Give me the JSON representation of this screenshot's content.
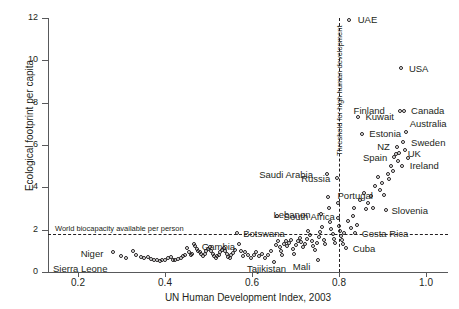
{
  "chart_data": {
    "type": "scatter",
    "title": "",
    "xlabel": "UN Human Development Index, 2003",
    "ylabel": "Ecological footprint per capita",
    "xlim": [
      0.13,
      1.05
    ],
    "ylim": [
      0,
      12
    ],
    "xticks": [
      0.2,
      0.4,
      0.6,
      0.8,
      1.0
    ],
    "xtick_labels": [
      "0.2",
      "0.4",
      "0.6",
      "0.8",
      "1.0"
    ],
    "yticks": [
      0,
      2,
      4,
      6,
      8,
      10,
      12
    ],
    "ytick_labels": [
      "0",
      "2",
      "4",
      "6",
      "8",
      "10",
      "12"
    ],
    "grid": false,
    "legend": null,
    "marker": "open-circle",
    "annotations": {
      "threshold_line": {
        "orientation": "vertical",
        "value": 0.8,
        "style": "dashed",
        "label": "Threshold for high human development"
      },
      "biocapacity_line": {
        "orientation": "horizontal",
        "value": 1.8,
        "style": "dashed",
        "label": "World biocapacity available per person"
      }
    },
    "labeled_points": [
      {
        "name": "UAE",
        "x": 0.824,
        "y": 11.9,
        "lx": 8,
        "ly": -5
      },
      {
        "name": "USA",
        "x": 0.944,
        "y": 9.6,
        "lx": 7,
        "ly": -5
      },
      {
        "name": "Canada",
        "x": 0.949,
        "y": 7.6,
        "lx": 7,
        "ly": -5
      },
      {
        "name": "Finland",
        "x": 0.941,
        "y": 7.6,
        "lx": -47,
        "ly": -5
      },
      {
        "name": "Kuwait",
        "x": 0.844,
        "y": 7.3,
        "lx": 7,
        "ly": -5
      },
      {
        "name": "Australia",
        "x": 0.955,
        "y": 6.6,
        "lx": 3,
        "ly": -13
      },
      {
        "name": "Estonia",
        "x": 0.853,
        "y": 6.5,
        "lx": 7,
        "ly": -5
      },
      {
        "name": "Sweden",
        "x": 0.949,
        "y": 6.1,
        "lx": 7,
        "ly": -5
      },
      {
        "name": "NZ",
        "x": 0.933,
        "y": 5.9,
        "lx": -20,
        "ly": -5
      },
      {
        "name": "UK",
        "x": 0.939,
        "y": 5.6,
        "lx": 8,
        "ly": -4
      },
      {
        "name": "Spain",
        "x": 0.928,
        "y": 5.4,
        "lx": -32,
        "ly": -5
      },
      {
        "name": "Ireland",
        "x": 0.946,
        "y": 5.0,
        "lx": 7,
        "ly": -5
      },
      {
        "name": "Saudi Arabia",
        "x": 0.772,
        "y": 4.6,
        "lx": -68,
        "ly": -5
      },
      {
        "name": "Russia",
        "x": 0.795,
        "y": 4.4,
        "lx": -36,
        "ly": -5
      },
      {
        "name": "Portugal",
        "x": 0.904,
        "y": 3.6,
        "lx": -47,
        "ly": -5
      },
      {
        "name": "Slovenia",
        "x": 0.904,
        "y": 2.9,
        "lx": 7,
        "ly": -5
      },
      {
        "name": "Lebanon",
        "x": 0.759,
        "y": 2.7,
        "lx": -48,
        "ly": -5
      },
      {
        "name": "South Africa",
        "x": 0.658,
        "y": 2.6,
        "lx": 6,
        "ly": -5
      },
      {
        "name": "Botswana",
        "x": 0.565,
        "y": 1.8,
        "lx": 6,
        "ly": -5
      },
      {
        "name": "Costa Rica",
        "x": 0.838,
        "y": 1.8,
        "lx": 6,
        "ly": -5
      },
      {
        "name": "Gambia",
        "x": 0.47,
        "y": 1.2,
        "lx": 6,
        "ly": -5
      },
      {
        "name": "Cuba",
        "x": 0.817,
        "y": 1.1,
        "lx": 6,
        "ly": -5
      },
      {
        "name": "Niger",
        "x": 0.281,
        "y": 0.9,
        "lx": -33,
        "ly": -4
      },
      {
        "name": "Tajikistan",
        "x": 0.652,
        "y": 0.45,
        "lx": -28,
        "ly": 2
      },
      {
        "name": "Mali",
        "x": 0.753,
        "y": 0.55,
        "lx": -26,
        "ly": 2
      },
      {
        "name": "Sierra Leone",
        "x": 0.298,
        "y": 0.45,
        "lx": -68,
        "ly": 2
      }
    ],
    "points": [
      [
        0.281,
        0.9
      ],
      [
        0.298,
        0.75
      ],
      [
        0.311,
        0.65
      ],
      [
        0.327,
        0.95
      ],
      [
        0.334,
        0.8
      ],
      [
        0.345,
        0.7
      ],
      [
        0.352,
        0.62
      ],
      [
        0.361,
        0.68
      ],
      [
        0.369,
        0.58
      ],
      [
        0.374,
        0.55
      ],
      [
        0.381,
        0.52
      ],
      [
        0.388,
        0.5
      ],
      [
        0.394,
        0.52
      ],
      [
        0.401,
        0.55
      ],
      [
        0.408,
        0.62
      ],
      [
        0.414,
        0.68
      ],
      [
        0.419,
        0.55
      ],
      [
        0.424,
        0.52
      ],
      [
        0.43,
        0.6
      ],
      [
        0.436,
        0.65
      ],
      [
        0.441,
        0.72
      ],
      [
        0.447,
        0.78
      ],
      [
        0.45,
        1.1
      ],
      [
        0.455,
        0.9
      ],
      [
        0.459,
        0.78
      ],
      [
        0.463,
        0.85
      ],
      [
        0.467,
        1.3
      ],
      [
        0.47,
        1.2
      ],
      [
        0.474,
        1.05
      ],
      [
        0.477,
        0.95
      ],
      [
        0.481,
        0.9
      ],
      [
        0.484,
        0.82
      ],
      [
        0.488,
        0.72
      ],
      [
        0.492,
        0.85
      ],
      [
        0.495,
        0.95
      ],
      [
        0.5,
        1.05
      ],
      [
        0.503,
        1.15
      ],
      [
        0.506,
        0.95
      ],
      [
        0.51,
        0.85
      ],
      [
        0.513,
        0.75
      ],
      [
        0.517,
        0.65
      ],
      [
        0.52,
        0.72
      ],
      [
        0.524,
        0.8
      ],
      [
        0.527,
        0.9
      ],
      [
        0.531,
        1.0
      ],
      [
        0.535,
        1.1
      ],
      [
        0.538,
        0.95
      ],
      [
        0.542,
        0.82
      ],
      [
        0.546,
        0.68
      ],
      [
        0.55,
        0.62
      ],
      [
        0.553,
        0.78
      ],
      [
        0.557,
        0.88
      ],
      [
        0.561,
        1.0
      ],
      [
        0.565,
        1.8
      ],
      [
        0.57,
        1.3
      ],
      [
        0.575,
        0.98
      ],
      [
        0.58,
        0.72
      ],
      [
        0.585,
        0.9
      ],
      [
        0.59,
        0.8
      ],
      [
        0.597,
        0.65
      ],
      [
        0.604,
        0.78
      ],
      [
        0.61,
        0.9
      ],
      [
        0.617,
        0.72
      ],
      [
        0.624,
        0.85
      ],
      [
        0.631,
        0.65
      ],
      [
        0.638,
        0.78
      ],
      [
        0.645,
        0.95
      ],
      [
        0.652,
        0.45
      ],
      [
        0.655,
        1.25
      ],
      [
        0.658,
        2.6
      ],
      [
        0.66,
        1.45
      ],
      [
        0.664,
        1.15
      ],
      [
        0.667,
        0.95
      ],
      [
        0.67,
        0.78
      ],
      [
        0.674,
        1.3
      ],
      [
        0.678,
        1.45
      ],
      [
        0.681,
        1.2
      ],
      [
        0.686,
        1.35
      ],
      [
        0.69,
        1.5
      ],
      [
        0.694,
        1.05
      ],
      [
        0.698,
        0.85
      ],
      [
        0.702,
        1.25
      ],
      [
        0.706,
        1.45
      ],
      [
        0.71,
        1.6
      ],
      [
        0.714,
        1.38
      ],
      [
        0.718,
        1.15
      ],
      [
        0.722,
        1.32
      ],
      [
        0.726,
        1.55
      ],
      [
        0.73,
        1.9
      ],
      [
        0.734,
        1.72
      ],
      [
        0.738,
        1.45
      ],
      [
        0.741,
        1.2
      ],
      [
        0.745,
        1.0
      ],
      [
        0.749,
        1.35
      ],
      [
        0.753,
        0.55
      ],
      [
        0.755,
        1.62
      ],
      [
        0.757,
        1.88
      ],
      [
        0.759,
        2.7
      ],
      [
        0.762,
        2.1
      ],
      [
        0.765,
        1.5
      ],
      [
        0.768,
        1.28
      ],
      [
        0.772,
        4.6
      ],
      [
        0.774,
        3.5
      ],
      [
        0.777,
        3.0
      ],
      [
        0.78,
        2.35
      ],
      [
        0.783,
        2.0
      ],
      [
        0.786,
        1.75
      ],
      [
        0.789,
        1.55
      ],
      [
        0.792,
        1.35
      ],
      [
        0.795,
        4.4
      ],
      [
        0.797,
        3.25
      ],
      [
        0.799,
        2.55
      ],
      [
        0.801,
        2.15
      ],
      [
        0.803,
        1.9
      ],
      [
        0.805,
        1.7
      ],
      [
        0.807,
        1.5
      ],
      [
        0.81,
        1.28
      ],
      [
        0.813,
        1.8
      ],
      [
        0.817,
        1.1
      ],
      [
        0.822,
        2.4
      ],
      [
        0.824,
        11.9
      ],
      [
        0.828,
        2.05
      ],
      [
        0.832,
        2.6
      ],
      [
        0.836,
        3.0
      ],
      [
        0.838,
        1.8
      ],
      [
        0.842,
        2.2
      ],
      [
        0.844,
        7.3
      ],
      [
        0.848,
        3.4
      ],
      [
        0.853,
        6.5
      ],
      [
        0.858,
        3.7
      ],
      [
        0.862,
        2.95
      ],
      [
        0.868,
        3.25
      ],
      [
        0.874,
        3.55
      ],
      [
        0.879,
        3.0
      ],
      [
        0.884,
        4.05
      ],
      [
        0.889,
        4.45
      ],
      [
        0.894,
        3.85
      ],
      [
        0.899,
        4.2
      ],
      [
        0.904,
        3.6
      ],
      [
        0.908,
        2.9
      ],
      [
        0.912,
        4.6
      ],
      [
        0.916,
        4.35
      ],
      [
        0.92,
        5.0
      ],
      [
        0.924,
        4.75
      ],
      [
        0.928,
        5.4
      ],
      [
        0.931,
        5.55
      ],
      [
        0.933,
        5.9
      ],
      [
        0.936,
        5.2
      ],
      [
        0.939,
        5.6
      ],
      [
        0.941,
        7.6
      ],
      [
        0.944,
        9.6
      ],
      [
        0.946,
        5.0
      ],
      [
        0.948,
        6.1
      ],
      [
        0.949,
        7.6
      ],
      [
        0.952,
        5.75
      ],
      [
        0.955,
        6.6
      ],
      [
        0.958,
        5.35
      ]
    ]
  }
}
